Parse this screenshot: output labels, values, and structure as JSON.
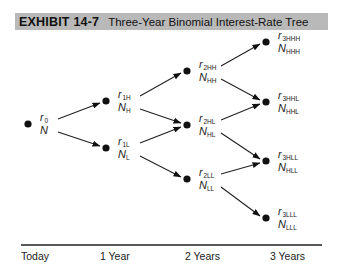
{
  "title": {
    "exhibit": "EXHIBIT 14-7",
    "text": "Three-Year Binomial Interest-Rate Tree",
    "bar_color": "#b9b9b9"
  },
  "diagram": {
    "type": "binomial-tree",
    "periods": [
      "Today",
      "1 Year",
      "2 Years",
      "3 Years"
    ],
    "nodes": [
      {
        "id": "0",
        "period": 0,
        "rate": "r",
        "rate_sub": "0",
        "value": "N",
        "value_sub": ""
      },
      {
        "id": "1H",
        "period": 1,
        "rate": "r",
        "rate_sub": "1H",
        "value": "N",
        "value_sub": "H"
      },
      {
        "id": "1L",
        "period": 1,
        "rate": "r",
        "rate_sub": "1L",
        "value": "N",
        "value_sub": "L"
      },
      {
        "id": "2HH",
        "period": 2,
        "rate": "r",
        "rate_sub": "2HH",
        "value": "N",
        "value_sub": "HH"
      },
      {
        "id": "2HL",
        "period": 2,
        "rate": "r",
        "rate_sub": "2HL",
        "value": "N",
        "value_sub": "HL"
      },
      {
        "id": "2LL",
        "period": 2,
        "rate": "r",
        "rate_sub": "2LL",
        "value": "N",
        "value_sub": "LL"
      },
      {
        "id": "3HHH",
        "period": 3,
        "rate": "r",
        "rate_sub": "3HHH",
        "value": "N",
        "value_sub": "HHH"
      },
      {
        "id": "3HHL",
        "period": 3,
        "rate": "r",
        "rate_sub": "3HHL",
        "value": "N",
        "value_sub": "HHL"
      },
      {
        "id": "3HLL",
        "period": 3,
        "rate": "r",
        "rate_sub": "3HLL",
        "value": "N",
        "value_sub": "HLL"
      },
      {
        "id": "3LLL",
        "period": 3,
        "rate": "r",
        "rate_sub": "3LLL",
        "value": "N",
        "value_sub": "LLL"
      }
    ],
    "edges": [
      [
        "0",
        "1H"
      ],
      [
        "0",
        "1L"
      ],
      [
        "1H",
        "2HH"
      ],
      [
        "1H",
        "2HL"
      ],
      [
        "1L",
        "2HL"
      ],
      [
        "1L",
        "2LL"
      ],
      [
        "2HH",
        "3HHH"
      ],
      [
        "2HH",
        "3HHL"
      ],
      [
        "2HL",
        "3HHL"
      ],
      [
        "2HL",
        "3HLL"
      ],
      [
        "2LL",
        "3HLL"
      ],
      [
        "2LL",
        "3LLL"
      ]
    ]
  }
}
